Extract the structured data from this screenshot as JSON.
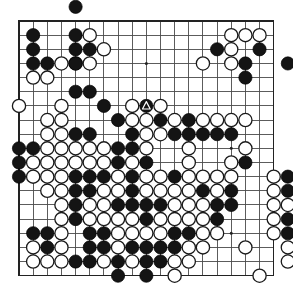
{
  "diagram": {
    "type": "go-board-diagram",
    "board_size": 19,
    "geometry": {
      "origin_x": 19,
      "origin_y": 21,
      "spacing": 14.15,
      "stone_radius": 6.6,
      "canvas_width": 293,
      "canvas_height": 302
    },
    "colors": {
      "background": "#ffffff",
      "grid": "#4a4a4a",
      "border": "#222222",
      "black_stone": "#141414",
      "white_stone": "#ffffff",
      "stone_outline": "#1a1a1a",
      "mark": "#ffffff"
    },
    "star_points": [
      [
        3,
        3
      ],
      [
        9,
        3
      ],
      [
        15,
        3
      ],
      [
        3,
        9
      ],
      [
        9,
        9
      ],
      [
        15,
        9
      ],
      [
        3,
        15
      ],
      [
        9,
        15
      ],
      [
        15,
        15
      ]
    ],
    "marks": [
      {
        "type": "triangle",
        "col": 9,
        "row": 6,
        "on": "black"
      }
    ],
    "black_stones": [
      [
        4,
        -1
      ],
      [
        1,
        1
      ],
      [
        1,
        2
      ],
      [
        1,
        3
      ],
      [
        2,
        3
      ],
      [
        4,
        1
      ],
      [
        4,
        2
      ],
      [
        5,
        2
      ],
      [
        4,
        3
      ],
      [
        4,
        5
      ],
      [
        5,
        5
      ],
      [
        14,
        2
      ],
      [
        17,
        2
      ],
      [
        16,
        3
      ],
      [
        19,
        3
      ],
      [
        16,
        4
      ],
      [
        20,
        5
      ],
      [
        6,
        6
      ],
      [
        9,
        6
      ],
      [
        7,
        7
      ],
      [
        10,
        7
      ],
      [
        12,
        7
      ],
      [
        4,
        8
      ],
      [
        5,
        8
      ],
      [
        8,
        8
      ],
      [
        11,
        8
      ],
      [
        12,
        8
      ],
      [
        13,
        8
      ],
      [
        14,
        8
      ],
      [
        15,
        8
      ],
      [
        0,
        9
      ],
      [
        1,
        9
      ],
      [
        7,
        9
      ],
      [
        8,
        9
      ],
      [
        0,
        10
      ],
      [
        7,
        10
      ],
      [
        9,
        10
      ],
      [
        16,
        10
      ],
      [
        0,
        11
      ],
      [
        4,
        11
      ],
      [
        5,
        11
      ],
      [
        6,
        11
      ],
      [
        8,
        11
      ],
      [
        11,
        11
      ],
      [
        19,
        11
      ],
      [
        20,
        11
      ],
      [
        4,
        12
      ],
      [
        5,
        12
      ],
      [
        8,
        12
      ],
      [
        13,
        12
      ],
      [
        15,
        12
      ],
      [
        19,
        12
      ],
      [
        22,
        12
      ],
      [
        4,
        13
      ],
      [
        7,
        13
      ],
      [
        8,
        13
      ],
      [
        9,
        13
      ],
      [
        10,
        13
      ],
      [
        14,
        13
      ],
      [
        15,
        13
      ],
      [
        20,
        13
      ],
      [
        21,
        13
      ],
      [
        4,
        14
      ],
      [
        9,
        14
      ],
      [
        14,
        14
      ],
      [
        19,
        14
      ],
      [
        20,
        14
      ],
      [
        1,
        15
      ],
      [
        2,
        15
      ],
      [
        5,
        15
      ],
      [
        6,
        15
      ],
      [
        11,
        15
      ],
      [
        12,
        15
      ],
      [
        19,
        15
      ],
      [
        20,
        15
      ],
      [
        2,
        16
      ],
      [
        5,
        16
      ],
      [
        6,
        16
      ],
      [
        8,
        16
      ],
      [
        9,
        16
      ],
      [
        10,
        16
      ],
      [
        11,
        16
      ],
      [
        20,
        16
      ],
      [
        4,
        17
      ],
      [
        5,
        17
      ],
      [
        7,
        17
      ],
      [
        9,
        17
      ],
      [
        10,
        17
      ],
      [
        7,
        18
      ],
      [
        9,
        18
      ]
    ],
    "white_stones": [
      [
        5,
        1
      ],
      [
        15,
        1
      ],
      [
        16,
        1
      ],
      [
        17,
        1
      ],
      [
        6,
        2
      ],
      [
        15,
        2
      ],
      [
        3,
        3
      ],
      [
        4,
        3
      ],
      [
        5,
        3
      ],
      [
        13,
        3
      ],
      [
        15,
        3
      ],
      [
        1,
        4
      ],
      [
        2,
        4
      ],
      [
        0,
        6
      ],
      [
        3,
        6
      ],
      [
        8,
        6
      ],
      [
        10,
        6
      ],
      [
        2,
        7
      ],
      [
        3,
        7
      ],
      [
        8,
        7
      ],
      [
        9,
        7
      ],
      [
        11,
        7
      ],
      [
        13,
        7
      ],
      [
        14,
        7
      ],
      [
        15,
        7
      ],
      [
        16,
        7
      ],
      [
        2,
        8
      ],
      [
        3,
        8
      ],
      [
        9,
        8
      ],
      [
        10,
        8
      ],
      [
        2,
        9
      ],
      [
        3,
        9
      ],
      [
        4,
        9
      ],
      [
        5,
        9
      ],
      [
        6,
        9
      ],
      [
        9,
        9
      ],
      [
        12,
        9
      ],
      [
        16,
        9
      ],
      [
        1,
        10
      ],
      [
        2,
        10
      ],
      [
        3,
        10
      ],
      [
        4,
        10
      ],
      [
        5,
        10
      ],
      [
        6,
        10
      ],
      [
        8,
        10
      ],
      [
        12,
        10
      ],
      [
        15,
        10
      ],
      [
        1,
        11
      ],
      [
        2,
        11
      ],
      [
        3,
        11
      ],
      [
        7,
        11
      ],
      [
        9,
        11
      ],
      [
        10,
        11
      ],
      [
        12,
        11
      ],
      [
        13,
        11
      ],
      [
        14,
        11
      ],
      [
        15,
        11
      ],
      [
        18,
        11
      ],
      [
        2,
        12
      ],
      [
        3,
        12
      ],
      [
        6,
        12
      ],
      [
        7,
        12
      ],
      [
        9,
        12
      ],
      [
        10,
        12
      ],
      [
        11,
        12
      ],
      [
        12,
        12
      ],
      [
        14,
        12
      ],
      [
        18,
        12
      ],
      [
        20,
        12
      ],
      [
        3,
        13
      ],
      [
        5,
        13
      ],
      [
        6,
        13
      ],
      [
        11,
        13
      ],
      [
        12,
        13
      ],
      [
        13,
        13
      ],
      [
        18,
        13
      ],
      [
        19,
        13
      ],
      [
        22,
        13
      ],
      [
        3,
        14
      ],
      [
        5,
        14
      ],
      [
        6,
        14
      ],
      [
        7,
        14
      ],
      [
        8,
        14
      ],
      [
        10,
        14
      ],
      [
        11,
        14
      ],
      [
        12,
        14
      ],
      [
        13,
        14
      ],
      [
        18,
        14
      ],
      [
        21,
        14
      ],
      [
        3,
        15
      ],
      [
        7,
        15
      ],
      [
        8,
        15
      ],
      [
        9,
        15
      ],
      [
        10,
        15
      ],
      [
        13,
        15
      ],
      [
        14,
        15
      ],
      [
        18,
        15
      ],
      [
        21,
        15
      ],
      [
        1,
        16
      ],
      [
        3,
        16
      ],
      [
        7,
        16
      ],
      [
        12,
        16
      ],
      [
        13,
        16
      ],
      [
        16,
        16
      ],
      [
        19,
        16
      ],
      [
        21,
        16
      ],
      [
        1,
        17
      ],
      [
        2,
        17
      ],
      [
        3,
        17
      ],
      [
        6,
        17
      ],
      [
        8,
        17
      ],
      [
        11,
        17
      ],
      [
        12,
        17
      ],
      [
        19,
        17
      ],
      [
        11,
        18
      ],
      [
        17,
        18
      ]
    ]
  }
}
